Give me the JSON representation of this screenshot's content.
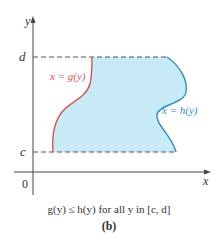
{
  "figure": {
    "axes": {
      "x_label": "x",
      "y_label": "y",
      "origin_label": "0"
    },
    "bounds": {
      "upper_label": "d",
      "lower_label": "c"
    },
    "curves": {
      "left": {
        "label": "x = g(y)",
        "color": "#d9534f"
      },
      "right": {
        "label": "x = h(y)",
        "color": "#2a8fc9"
      }
    },
    "region_fill": "#c9ebf7",
    "caption": "g(y) ≤ h(y) for all y in [c, d]",
    "sublabel": "(b)"
  }
}
